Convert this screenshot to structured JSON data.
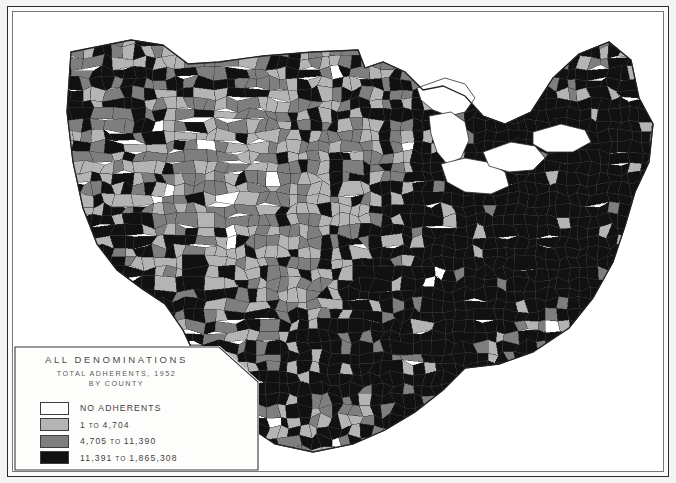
{
  "map": {
    "title_line1": "ALL  DENOMINATIONS",
    "title_line2": "TOTAL  ADHERENTS, 1952",
    "title_line3": "BY  COUNTY",
    "region": "United States",
    "unit": "county",
    "projection": "conic"
  },
  "legend": {
    "entries": [
      {
        "label": "NO ADHERENTS",
        "range_text": "NO ADHERENTS",
        "color": "#ffffff",
        "min": 0,
        "max": 0
      },
      {
        "label": "1 TO 4,704",
        "value_low": "1",
        "sep": "TO",
        "value_high": "4,704",
        "color": "#b4b4b4",
        "min": 1,
        "max": 4704
      },
      {
        "label": "4,705 TO 11,390",
        "value_low": "4,705",
        "sep": "TO",
        "value_high": "11,390",
        "color": "#7e7e7e",
        "min": 4705,
        "max": 11390
      },
      {
        "label": "11,391 TO 1,865,308",
        "value_low": "11,391",
        "sep": "TO",
        "value_high": "1,865,308",
        "color": "#111111",
        "min": 11391,
        "max": 1865308
      }
    ]
  },
  "chart_data": {
    "type": "map",
    "subtype": "choropleth",
    "title": "ALL DENOMINATIONS",
    "subtitle": "TOTAL ADHERENTS, 1952 BY COUNTY",
    "geography": "United States counties",
    "variable": "total church adherents",
    "year": 1952,
    "class_count": 4,
    "classes": [
      {
        "bin": "NO ADHERENTS",
        "min": 0,
        "max": 0,
        "color": "#ffffff"
      },
      {
        "bin": "1 TO 4,704",
        "min": 1,
        "max": 4704,
        "color": "#b4b4b4"
      },
      {
        "bin": "4,705 TO 11,390",
        "min": 4705,
        "max": 11390,
        "color": "#7e7e7e"
      },
      {
        "bin": "11,391 TO 1,865,308",
        "min": 11391,
        "max": 1865308,
        "color": "#111111"
      }
    ],
    "data_max": 1865308,
    "data_min": 0,
    "legend_position": "bottom-left"
  },
  "colors": {
    "class_none": "#ffffff",
    "class_low": "#b4b4b4",
    "class_mid": "#7e7e7e",
    "class_high": "#111111",
    "frame": "#2a2a2a",
    "paper": "#fbfbfa",
    "stroke": "#3a3a3a"
  }
}
